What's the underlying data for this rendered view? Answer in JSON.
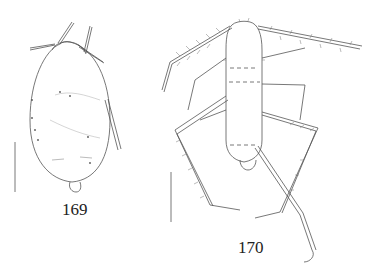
{
  "figures": [
    {
      "number": "169",
      "subject": "apterous aphid, dorsal view, oval body",
      "scale_bar": true
    },
    {
      "number": "170",
      "subject": "aphid nymph with long hairy legs and antennae, dorsal view",
      "scale_bar": true
    }
  ],
  "colors": {
    "line": "#555555",
    "background": "#ffffff",
    "text": "#222222"
  }
}
